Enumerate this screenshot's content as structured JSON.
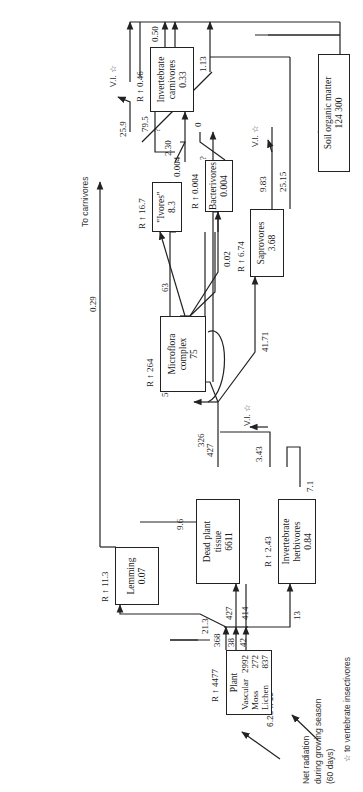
{
  "diagram": {
    "orientation": "rotated 90deg counter-clockwise",
    "input": {
      "label_lines": [
        "Net radiation",
        "during growing season",
        "(60 days)"
      ],
      "value": "6.28 x 10",
      "exponent": "5"
    },
    "footnote": "☆ to vertebrate insectivores",
    "output_to_carnivores": {
      "label": "To carnivores",
      "value": "0.29"
    },
    "respiration_symbol": "R",
    "vi_label": "V.I. ☆",
    "nodes": {
      "plant": {
        "title": "Plant",
        "rows": [
          {
            "name": "Vascular",
            "value": "2992"
          },
          {
            "name": "Moss",
            "value": "272"
          },
          {
            "name": "Lichen",
            "value": "837"
          }
        ],
        "respiration": "4477"
      },
      "lemming": {
        "name": "Lemming",
        "value": "0.07",
        "respiration": "11.3"
      },
      "dead_plant": {
        "name_lines": [
          "Dead plant",
          "tissue"
        ],
        "value": "6611"
      },
      "inv_herbivores": {
        "name_lines": [
          "Invertebrate",
          "herbivores"
        ],
        "value": "0.84",
        "respiration": "2.43"
      },
      "microflora": {
        "name_lines": [
          "Microflora",
          "complex"
        ],
        "value": "75",
        "respiration": "264"
      },
      "saprovores": {
        "name": "Saprovores",
        "value": "3.68",
        "respiration": "6.74"
      },
      "bacterivores": {
        "name": "Bacterivores",
        "value": "0.004",
        "respiration": "0.004"
      },
      "ivores": {
        "name": "\"Ivores\"",
        "value": "8.3",
        "respiration": "16.7"
      },
      "inv_carnivores": {
        "name_lines": [
          "Invertebrate",
          "carnivores"
        ],
        "value": "0.33",
        "respiration": "0.46"
      },
      "soil": {
        "name": "Soil organic matter",
        "value": "124 300"
      }
    },
    "flows": {
      "plant_vascular_out": "368",
      "plant_moss_out": "38",
      "plant_lichen_out": "42",
      "to_lemming": "21.3",
      "to_dead_plant": "427",
      "dead_plant_in_414": "414",
      "to_inv_herbivores": "13",
      "lemming_to_dead_plant": "9.6",
      "dead_plant_out": "427",
      "to_microflora": "326",
      "to_ivores_59": "59",
      "microflora_to_ivores": "63",
      "microflora_to_bacterivores": "0.02",
      "to_saprovores": "41.71",
      "herbivores_to_dead": "3.43",
      "herbivores_loop": "7.1",
      "bacterivores_out": "0.004",
      "saprovores_vi": "9.83",
      "saprovores_to_soil": "25.15",
      "ivores_vi": "25.9",
      "ivores_out": "79.5",
      "to_inv_carnivores": "2.30",
      "question_1": "?",
      "question_2": "?",
      "zero": "0",
      "carnivores_out": "0.50",
      "carnivores_loop": "1.13"
    }
  }
}
